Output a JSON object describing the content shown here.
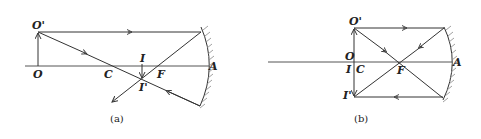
{
  "figure": {
    "panels": [
      {
        "id": "a",
        "caption": "(a)",
        "labels": {
          "object_top": "O'",
          "object_base": "O",
          "center": "C",
          "focus": "F",
          "vertex": "A",
          "image_base": "I",
          "image_top": "I'"
        },
        "description": "Concave mirror with object O O' beyond C; real inverted diminished image I I' formed between C and F"
      },
      {
        "id": "b",
        "caption": "(b)",
        "labels": {
          "object_top": "O'",
          "object_base": "O",
          "center": "C",
          "focus": "F",
          "vertex": "A",
          "image_base": "I",
          "image_top": "I'"
        },
        "description": "Concave mirror with object at C; real inverted same-size image formed at C"
      }
    ]
  }
}
